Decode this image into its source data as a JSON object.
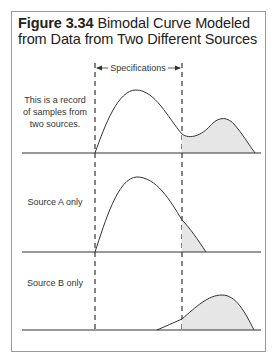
{
  "figure": {
    "number": "Figure 3.34",
    "title": "Bimodal Curve Modeled from Data from Two Different Sources",
    "title_line1": "Bimodal Curve Modeled",
    "title_line2": "from Data from Two Different Sources"
  },
  "spec_label": "Specifications",
  "panels": [
    {
      "id": "combined",
      "label": "This is a record of samples from two sources.",
      "label_lines": [
        "This is a record",
        "of samples from",
        "two sources."
      ]
    },
    {
      "id": "source-a",
      "label": "Source A only"
    },
    {
      "id": "source-b",
      "label": "Source B only"
    }
  ],
  "colors": {
    "line": "#333333",
    "fill": "#e6e6e6",
    "frame": "#9a9a9a",
    "dash": "#444444"
  }
}
